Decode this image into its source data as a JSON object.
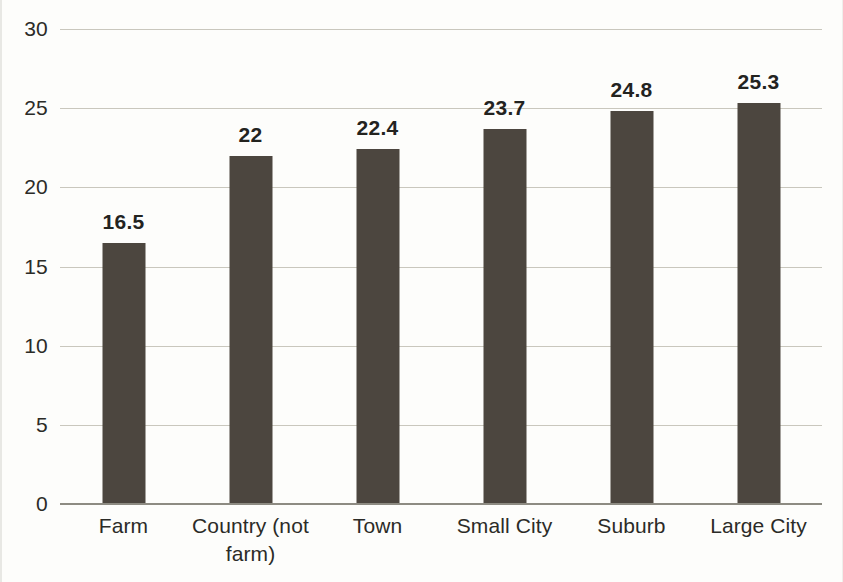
{
  "chart_data": {
    "type": "bar",
    "title": "",
    "subtitle": "",
    "xlabel": "",
    "ylabel": "",
    "categories": [
      "Farm",
      "Country (not farm)",
      "Town",
      "Small City",
      "Suburb",
      "Large City"
    ],
    "values": [
      16.5,
      22,
      22.4,
      23.7,
      24.8,
      25.3
    ],
    "data_labels": [
      "16.5",
      "22",
      "22.4",
      "23.7",
      "24.8",
      "25.3"
    ],
    "ylim": [
      0,
      30
    ],
    "ytick_labels": [
      "30",
      "25",
      "20",
      "15",
      "10",
      "5",
      "0"
    ],
    "ytick_values": [
      30,
      25,
      20,
      15,
      10,
      5,
      0
    ],
    "grid": true,
    "grid_axis": "y",
    "legend": null,
    "legend_position": "none",
    "bar_color": "#4c463f",
    "gridline_color": "#c9c7bd",
    "axis_color": "#8d8b82",
    "text_color": "#2b2b27",
    "background_color": "#fdfdfb"
  }
}
